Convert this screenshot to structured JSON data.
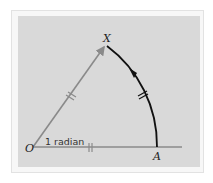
{
  "diagram": {
    "labels": {
      "origin": "O",
      "point_a": "A",
      "point_x": "X",
      "angle": "1 radian"
    },
    "colors": {
      "background": "#ffffff",
      "panel": "#d9d9d9",
      "radius_line": "#8a8a8a",
      "arc": "#111111",
      "text": "#222222"
    }
  }
}
